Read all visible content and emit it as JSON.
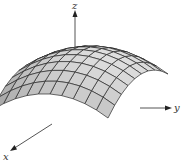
{
  "figure": {
    "type": "3d-surface",
    "axes": {
      "x": {
        "label": "x"
      },
      "y": {
        "label": "y"
      },
      "z": {
        "label": "z"
      }
    },
    "colors": {
      "surface_light": "#e4e4e4",
      "surface_dark": "#9a9a9a",
      "mesh_line": "#2a2a2a",
      "axis_line": "#444444",
      "background": "#ffffff"
    },
    "mesh": {
      "rows": 9,
      "cols": 10
    }
  }
}
